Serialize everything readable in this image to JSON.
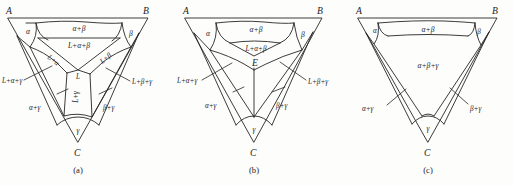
{
  "figure": {
    "kind": "ternary-isothermal-sections",
    "background_color": "#fdfdfc",
    "line_color": "#262626",
    "text_color": "#1c1c1c",
    "panels": [
      {
        "caption": "(a)",
        "vertices": {
          "left": "A",
          "right": "B",
          "bottom": "C"
        },
        "regions": [
          {
            "name": "alpha",
            "label": "α"
          },
          {
            "name": "alpha-beta",
            "label": "α+β"
          },
          {
            "name": "beta",
            "label": "β"
          },
          {
            "name": "liquid-alpha-beta",
            "label": "L+α+β"
          },
          {
            "name": "liquid-alpha",
            "label": "L+α"
          },
          {
            "name": "liquid-beta",
            "label": "L+β"
          },
          {
            "name": "liquid",
            "label": "L"
          },
          {
            "name": "liquid-gamma",
            "label": "L+γ"
          },
          {
            "name": "liquid-alpha-gamma",
            "label": "L+α+γ"
          },
          {
            "name": "liquid-beta-gamma",
            "label": "L+β+γ"
          },
          {
            "name": "alpha-gamma",
            "label": "α+γ"
          },
          {
            "name": "beta-gamma",
            "label": "β+γ"
          },
          {
            "name": "gamma",
            "label": "γ"
          }
        ]
      },
      {
        "caption": "(b)",
        "vertices": {
          "left": "A",
          "right": "B",
          "bottom": "C"
        },
        "regions": [
          {
            "name": "alpha",
            "label": "α"
          },
          {
            "name": "alpha-beta",
            "label": "α+β"
          },
          {
            "name": "beta",
            "label": "β"
          },
          {
            "name": "liquid-alpha-beta",
            "label": "L+α+β"
          },
          {
            "name": "eutectic-point",
            "label": "E"
          },
          {
            "name": "liquid-alpha-gamma",
            "label": "L+α+γ"
          },
          {
            "name": "liquid-beta-gamma",
            "label": "L+β+γ"
          },
          {
            "name": "alpha-gamma",
            "label": "α+γ"
          },
          {
            "name": "beta-gamma",
            "label": "β+γ"
          },
          {
            "name": "gamma",
            "label": "γ"
          }
        ]
      },
      {
        "caption": "(c)",
        "vertices": {
          "left": "A",
          "right": "B",
          "bottom": "C"
        },
        "regions": [
          {
            "name": "alpha",
            "label": "α"
          },
          {
            "name": "alpha-beta",
            "label": "α+β"
          },
          {
            "name": "beta",
            "label": "β"
          },
          {
            "name": "alpha-beta-gamma",
            "label": "α+β+γ"
          },
          {
            "name": "alpha-gamma",
            "label": "α+γ"
          },
          {
            "name": "beta-gamma",
            "label": "β+γ"
          },
          {
            "name": "gamma",
            "label": "γ"
          }
        ]
      }
    ]
  }
}
